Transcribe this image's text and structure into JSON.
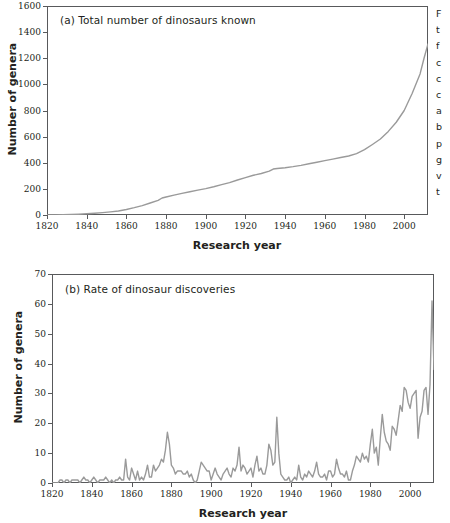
{
  "figure": {
    "line_color": "#9a9a9a",
    "frame_color": "#58595b",
    "background": "#ffffff"
  },
  "side_caption": {
    "lines": [
      "F",
      "t",
      "f",
      "c",
      "c",
      "c",
      "a",
      "b",
      "p",
      "g",
      "v",
      "t"
    ],
    "note": "caption text clipped at right image edge"
  },
  "chart_data": [
    {
      "type": "line",
      "title": "(a) Total number of dinosaurs known",
      "panel": "a",
      "xlabel": "Research year",
      "ylabel": "Number of genera",
      "xlim": [
        1820,
        2012
      ],
      "ylim": [
        0,
        1600
      ],
      "grid": false,
      "legend": "none",
      "xticks": [
        1820,
        1840,
        1860,
        1880,
        1900,
        1920,
        1940,
        1960,
        1980,
        2000
      ],
      "yticks": [
        0,
        200,
        400,
        600,
        800,
        1000,
        1200,
        1400,
        1600
      ],
      "series": [
        {
          "name": "Cumulative dinosaur genera",
          "x": [
            1820,
            1824,
            1828,
            1832,
            1836,
            1840,
            1844,
            1848,
            1852,
            1856,
            1860,
            1864,
            1868,
            1872,
            1876,
            1878,
            1880,
            1884,
            1888,
            1892,
            1896,
            1900,
            1904,
            1908,
            1912,
            1916,
            1920,
            1924,
            1928,
            1932,
            1934,
            1936,
            1940,
            1944,
            1948,
            1952,
            1956,
            1960,
            1964,
            1968,
            1972,
            1976,
            1980,
            1984,
            1988,
            1992,
            1996,
            2000,
            2004,
            2008,
            2010,
            2012
          ],
          "values": [
            0,
            1,
            2,
            4,
            6,
            9,
            13,
            18,
            24,
            31,
            42,
            56,
            72,
            92,
            112,
            130,
            138,
            152,
            166,
            178,
            190,
            202,
            216,
            232,
            248,
            268,
            286,
            304,
            318,
            336,
            352,
            356,
            362,
            370,
            380,
            392,
            404,
            416,
            428,
            440,
            452,
            470,
            500,
            540,
            582,
            640,
            710,
            800,
            930,
            1080,
            1200,
            1310
          ]
        }
      ]
    },
    {
      "type": "line",
      "title": "(b) Rate of dinosaur discoveries",
      "panel": "b",
      "xlabel": "Research year",
      "ylabel": "Number of genera",
      "xlim": [
        1820,
        2012
      ],
      "ylim": [
        0,
        70
      ],
      "grid": false,
      "legend": "none",
      "xticks": [
        1820,
        1840,
        1860,
        1880,
        1900,
        1920,
        1940,
        1960,
        1980,
        2000
      ],
      "yticks": [
        0,
        10,
        20,
        30,
        40,
        50,
        60,
        70
      ],
      "series": [
        {
          "name": "Dinosaur genera named per year",
          "x": [
            1820,
            1821,
            1822,
            1823,
            1824,
            1825,
            1826,
            1827,
            1828,
            1829,
            1830,
            1831,
            1832,
            1833,
            1834,
            1835,
            1836,
            1837,
            1838,
            1839,
            1840,
            1841,
            1842,
            1843,
            1844,
            1845,
            1846,
            1847,
            1848,
            1849,
            1850,
            1851,
            1852,
            1853,
            1854,
            1855,
            1856,
            1857,
            1858,
            1859,
            1860,
            1861,
            1862,
            1863,
            1864,
            1865,
            1866,
            1867,
            1868,
            1869,
            1870,
            1871,
            1872,
            1873,
            1874,
            1875,
            1876,
            1877,
            1878,
            1879,
            1880,
            1881,
            1882,
            1883,
            1884,
            1885,
            1886,
            1887,
            1888,
            1889,
            1890,
            1891,
            1892,
            1893,
            1894,
            1895,
            1896,
            1897,
            1898,
            1899,
            1900,
            1901,
            1902,
            1903,
            1904,
            1905,
            1906,
            1907,
            1908,
            1909,
            1910,
            1911,
            1912,
            1913,
            1914,
            1915,
            1916,
            1917,
            1918,
            1919,
            1920,
            1921,
            1922,
            1923,
            1924,
            1925,
            1926,
            1927,
            1928,
            1929,
            1930,
            1931,
            1932,
            1933,
            1934,
            1935,
            1936,
            1937,
            1938,
            1939,
            1940,
            1941,
            1942,
            1943,
            1944,
            1945,
            1946,
            1947,
            1948,
            1949,
            1950,
            1951,
            1952,
            1953,
            1954,
            1955,
            1956,
            1957,
            1958,
            1959,
            1960,
            1961,
            1962,
            1963,
            1964,
            1965,
            1966,
            1967,
            1968,
            1969,
            1970,
            1971,
            1972,
            1973,
            1974,
            1975,
            1976,
            1977,
            1978,
            1979,
            1980,
            1981,
            1982,
            1983,
            1984,
            1985,
            1986,
            1987,
            1988,
            1989,
            1990,
            1991,
            1992,
            1993,
            1994,
            1995,
            1996,
            1997,
            1998,
            1999,
            2000,
            2001,
            2002,
            2003,
            2004,
            2005,
            2006,
            2007,
            2008,
            2009,
            2010,
            2011,
            2012
          ],
          "values": [
            0,
            0,
            0,
            0,
            1,
            1,
            0,
            1,
            1,
            0,
            1,
            1,
            1,
            1,
            0,
            1,
            2,
            1,
            1,
            0,
            1,
            2,
            1,
            0,
            1,
            1,
            1,
            2,
            1,
            0,
            1,
            0,
            1,
            1,
            2,
            1,
            1,
            8,
            2,
            1,
            5,
            3,
            1,
            4,
            1,
            2,
            1,
            3,
            6,
            2,
            2,
            6,
            4,
            5,
            6,
            8,
            7,
            11,
            17,
            13,
            6,
            5,
            3,
            4,
            4,
            4,
            3,
            3,
            4,
            2,
            3,
            1,
            0,
            1,
            4,
            7,
            6,
            5,
            4,
            4,
            1,
            3,
            5,
            3,
            2,
            1,
            3,
            4,
            5,
            3,
            2,
            5,
            4,
            6,
            12,
            4,
            6,
            5,
            3,
            4,
            5,
            2,
            6,
            9,
            4,
            5,
            3,
            3,
            6,
            13,
            11,
            6,
            7,
            22,
            10,
            3,
            2,
            1,
            1,
            2,
            0,
            1,
            2,
            1,
            6,
            2,
            1,
            3,
            2,
            4,
            3,
            2,
            4,
            7,
            3,
            2,
            2,
            3,
            1,
            4,
            4,
            2,
            3,
            8,
            5,
            3,
            3,
            2,
            4,
            1,
            1,
            4,
            6,
            9,
            8,
            7,
            10,
            8,
            9,
            7,
            13,
            18,
            10,
            12,
            6,
            15,
            23,
            17,
            14,
            13,
            11,
            19,
            18,
            16,
            21,
            26,
            24,
            32,
            31,
            27,
            25,
            29,
            30,
            31,
            15,
            22,
            24,
            31,
            32,
            23,
            33,
            61,
            38,
            40
          ]
        }
      ]
    }
  ]
}
